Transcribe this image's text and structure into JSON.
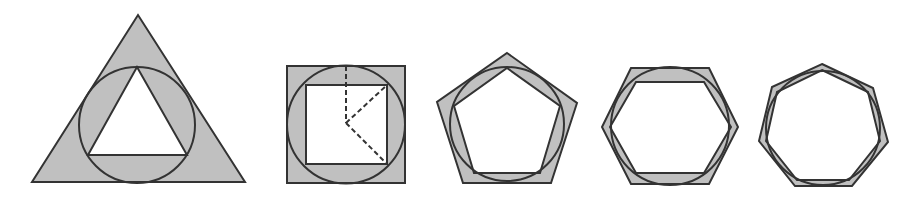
{
  "diagram": {
    "colors": {
      "fill": "#c0c0c0",
      "stroke": "#333333",
      "inner_fill": "#ffffff",
      "background": "#ffffff"
    },
    "figures": [
      {
        "id": "triangle",
        "sides": 3,
        "outer_polygon": [
          [
            32,
            182
          ],
          [
            245,
            182
          ],
          [
            138,
            15
          ]
        ],
        "circle": {
          "cx": 137,
          "cy": 125,
          "r": 58
        },
        "inner_polygon": [
          [
            88,
            155
          ],
          [
            187,
            155
          ],
          [
            137,
            67
          ]
        ]
      },
      {
        "id": "square",
        "sides": 4,
        "outer_polygon": [
          [
            287,
            66
          ],
          [
            405,
            66
          ],
          [
            405,
            183
          ],
          [
            287,
            183
          ]
        ],
        "circle": {
          "cx": 346,
          "cy": 124.5,
          "r": 59
        },
        "inner_polygon": [
          [
            306,
            85
          ],
          [
            387,
            85
          ],
          [
            387,
            164
          ],
          [
            306,
            164
          ]
        ],
        "dashed_lines": [
          [
            [
              346,
              66
            ],
            [
              346,
              123
            ]
          ],
          [
            [
              346,
              123
            ],
            [
              387,
              85
            ]
          ],
          [
            [
              346,
              123
            ],
            [
              387,
              164
            ]
          ]
        ]
      },
      {
        "id": "pentagon",
        "sides": 5,
        "outer_polygon": [
          [
            507,
            53
          ],
          [
            577,
            103
          ],
          [
            551,
            183
          ],
          [
            463,
            183
          ],
          [
            437,
            102
          ]
        ],
        "circle": {
          "cx": 507,
          "cy": 124,
          "r": 57
        },
        "inner_polygon": [
          [
            507,
            68
          ],
          [
            560,
            106
          ],
          [
            540,
            173
          ],
          [
            474,
            173
          ],
          [
            454,
            106
          ]
        ]
      },
      {
        "id": "hexagon",
        "sides": 6,
        "outer_polygon": [
          [
            631,
            68
          ],
          [
            709,
            68
          ],
          [
            738,
            127
          ],
          [
            709,
            184
          ],
          [
            631,
            184
          ],
          [
            602,
            127
          ]
        ],
        "circle": {
          "cx": 670,
          "cy": 126,
          "r": 59
        },
        "inner_polygon": [
          [
            636,
            82
          ],
          [
            704,
            82
          ],
          [
            731,
            127
          ],
          [
            704,
            173
          ],
          [
            636,
            173
          ],
          [
            610,
            127
          ]
        ]
      },
      {
        "id": "heptagon",
        "sides": 7,
        "outer_polygon": [
          [
            822,
            64
          ],
          [
            873,
            88
          ],
          [
            888,
            142
          ],
          [
            852,
            186
          ],
          [
            795,
            186
          ],
          [
            759,
            141
          ],
          [
            772,
            87
          ]
        ],
        "circle": {
          "cx": 823,
          "cy": 128,
          "r": 57
        },
        "inner_polygon": [
          [
            822,
            70
          ],
          [
            868,
            92
          ],
          [
            880,
            141
          ],
          [
            849,
            180
          ],
          [
            797,
            180
          ],
          [
            766,
            141
          ],
          [
            777,
            92
          ]
        ]
      }
    ]
  }
}
